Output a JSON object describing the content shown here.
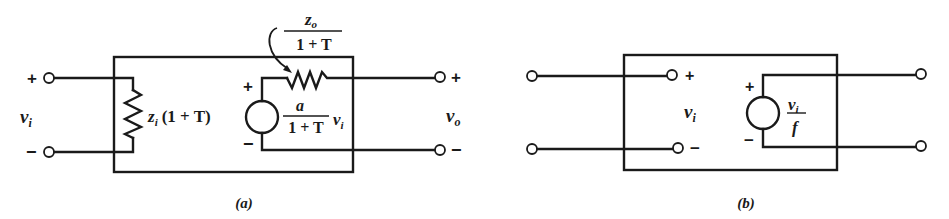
{
  "figure": {
    "panels": [
      {
        "id": "a",
        "caption": "(a)",
        "input_voltage": {
          "symbol": "v",
          "subscript": "i"
        },
        "output_voltage": {
          "symbol": "v",
          "subscript": "o"
        },
        "input_plus": "+",
        "input_minus": "−",
        "output_plus": "+",
        "output_minus": "−",
        "input_impedance": {
          "symbol": "z",
          "subscript": "i",
          "factor": "(1 + T)"
        },
        "output_impedance": {
          "numerator_symbol": "z",
          "numerator_subscript": "o",
          "denominator": "1 + T"
        },
        "source": {
          "plus": "+",
          "minus": "−",
          "gain_numerator": "a",
          "gain_denominator": "1 + T",
          "control_symbol": "v",
          "control_subscript": "i"
        }
      },
      {
        "id": "b",
        "caption": "(b)",
        "input_voltage": {
          "symbol": "v",
          "subscript": "i"
        },
        "inner_plus": "+",
        "inner_minus": "−",
        "source": {
          "plus": "+",
          "minus": "−",
          "numerator_symbol": "v",
          "numerator_subscript": "i",
          "denominator": "f"
        }
      }
    ]
  }
}
